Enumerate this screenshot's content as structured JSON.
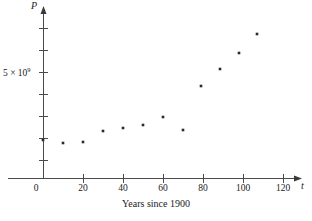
{
  "chart_data": {
    "type": "scatter",
    "title": "",
    "caption": "Years since 1900",
    "xlabel": "t",
    "ylabel": "P",
    "xlim": [
      -10,
      130
    ],
    "ylim": [
      0,
      8.4
    ],
    "grid": false,
    "legend": null,
    "x_ticks": [
      {
        "value": 0,
        "label": "0"
      },
      {
        "value": 20,
        "label": "20"
      },
      {
        "value": 40,
        "label": "40"
      },
      {
        "value": 60,
        "label": "60"
      },
      {
        "value": 80,
        "label": "80"
      },
      {
        "value": 100,
        "label": "100"
      },
      {
        "value": 120,
        "label": "120"
      }
    ],
    "y_ticks": [
      {
        "value": 1,
        "label": ""
      },
      {
        "value": 2,
        "label": ""
      },
      {
        "value": 3,
        "label": ""
      },
      {
        "value": 4,
        "label": ""
      },
      {
        "value": 5,
        "label": "5 × 10",
        "exponent": "9"
      },
      {
        "value": 6,
        "label": ""
      },
      {
        "value": 7,
        "label": ""
      }
    ],
    "y_tick_label_main": "5 × 10",
    "y_tick_label_exponent": "9",
    "x": [
      0,
      10,
      20,
      30,
      40,
      50,
      60,
      70,
      80,
      90,
      100,
      110
    ],
    "y": [
      1.65,
      1.6,
      1.65,
      2.1,
      2.25,
      2.4,
      2.75,
      3.3,
      3.95,
      4.75,
      5.5,
      6.4
    ],
    "points": [
      {
        "t": 0,
        "P": 1.65,
        "px": 43,
        "py": 140
      },
      {
        "t": 10,
        "P": 1.6,
        "px": 63,
        "py": 143
      },
      {
        "t": 20,
        "P": 1.65,
        "px": 83,
        "py": 142
      },
      {
        "t": 30,
        "P": 2.1,
        "px": 103,
        "py": 131
      },
      {
        "t": 40,
        "P": 2.25,
        "px": 123,
        "py": 128
      },
      {
        "t": 50,
        "P": 2.4,
        "px": 143,
        "py": 125
      },
      {
        "t": 60,
        "P": 2.75,
        "px": 163,
        "py": 117
      },
      {
        "t": 70,
        "P": 3.3,
        "px": 183,
        "py": 130
      },
      {
        "t": 80,
        "P": 3.95,
        "px": 201,
        "py": 86
      },
      {
        "t": 90,
        "P": 4.75,
        "px": 220,
        "py": 69
      },
      {
        "t": 100,
        "P": 5.5,
        "px": 239,
        "py": 53
      },
      {
        "t": 110,
        "P": 6.4,
        "px": 257,
        "py": 34
      }
    ],
    "axis_colors": {
      "axis": "#4a4a4a",
      "point": "#2a2a2a",
      "text": "#1a1a1a",
      "background": "#ffffff"
    }
  }
}
